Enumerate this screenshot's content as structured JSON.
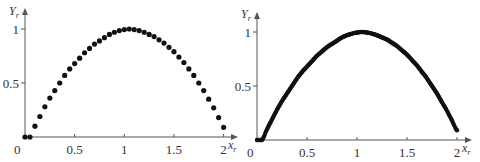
{
  "chart_data": [
    {
      "type": "scatter",
      "title": "",
      "xlabel": "x_r",
      "ylabel": "Y_r",
      "xlabel_main": "x",
      "xlabel_sub": "r",
      "ylabel_main": "Y",
      "ylabel_sub": "r",
      "xlim": [
        0,
        2
      ],
      "ylim": [
        0,
        1
      ],
      "origin_label": "0",
      "xticks": [
        0.5,
        1,
        1.5,
        2
      ],
      "xtick_labels": [
        "0.5",
        "1",
        "1.5",
        "2"
      ],
      "yticks": [
        0.5,
        1
      ],
      "ytick_labels": [
        "0.5",
        "1"
      ],
      "grid": false,
      "series": [
        {
          "name": "coarse",
          "marker": "circle",
          "x": [
            0,
            0.05,
            0.1,
            0.15,
            0.2,
            0.25,
            0.3,
            0.35,
            0.4,
            0.45,
            0.5,
            0.55,
            0.6,
            0.65,
            0.7,
            0.75,
            0.8,
            0.85,
            0.9,
            0.95,
            1.0,
            1.05,
            1.1,
            1.15,
            1.2,
            1.25,
            1.3,
            1.35,
            1.4,
            1.45,
            1.5,
            1.55,
            1.6,
            1.65,
            1.7,
            1.75,
            1.8,
            1.85,
            1.9,
            1.95,
            2.0
          ],
          "y": [
            0,
            0,
            0.1,
            0.19,
            0.28,
            0.36,
            0.43,
            0.5,
            0.57,
            0.63,
            0.68,
            0.73,
            0.78,
            0.82,
            0.86,
            0.89,
            0.92,
            0.95,
            0.97,
            0.985,
            0.995,
            1.0,
            0.995,
            0.985,
            0.97,
            0.95,
            0.93,
            0.9,
            0.87,
            0.83,
            0.79,
            0.74,
            0.69,
            0.63,
            0.57,
            0.5,
            0.43,
            0.35,
            0.27,
            0.18,
            0.09
          ]
        }
      ]
    },
    {
      "type": "scatter",
      "title": "",
      "xlabel": "x_r",
      "ylabel": "Y_r",
      "xlabel_main": "x",
      "xlabel_sub": "r",
      "ylabel_main": "Y",
      "ylabel_sub": "r",
      "xlim": [
        0,
        2
      ],
      "ylim": [
        0,
        1
      ],
      "origin_label": "0",
      "xticks": [
        0.5,
        1,
        1.5,
        2
      ],
      "xtick_labels": [
        "0.5",
        "1",
        "1.5",
        "2"
      ],
      "yticks": [
        0.5,
        1
      ],
      "ytick_labels": [
        "0.5",
        "1"
      ],
      "grid": false,
      "series": [
        {
          "name": "fine",
          "marker": "circle",
          "x_start": 0,
          "x_end": 2.0,
          "x_step": 0.01,
          "curve_reference": "same profile as coarse series, densely sampled",
          "y_at_key_x": {
            "0": 0,
            "0.05": 0,
            "0.5": 0.68,
            "1.05": 1.0,
            "1.5": 0.79,
            "2.0": 0.09
          }
        }
      ]
    }
  ]
}
